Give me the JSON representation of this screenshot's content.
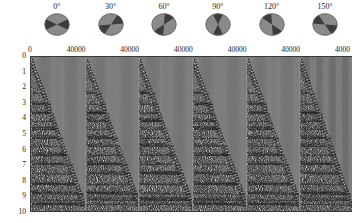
{
  "figure": {
    "type": "seismic-shot-gather-panels",
    "panel_count": 6
  },
  "beachballs": {
    "items": [
      {
        "label": "0°",
        "angle": 0,
        "icon": "beachball-icon"
      },
      {
        "label": "30°",
        "angle": 30,
        "icon": "beachball-icon"
      },
      {
        "label": "60°",
        "angle": 60,
        "icon": "beachball-icon"
      },
      {
        "label": "90°",
        "angle": 90,
        "icon": "beachball-icon"
      },
      {
        "label": "120°",
        "angle": 120,
        "icon": "beachball-icon"
      },
      {
        "label": "150°",
        "angle": 150,
        "icon": "beachball-icon"
      }
    ],
    "fill_color": "#8a8a8a",
    "quadrant_color": "#3c3c3c",
    "edge_color": "#6f6f6f"
  },
  "xaxis": {
    "tick_labels": [
      "0",
      "4000"
    ],
    "min": 0,
    "max": 4000,
    "repeat_per_panel": true
  },
  "yaxis": {
    "tick_labels": [
      "0",
      "1",
      "2",
      "3",
      "4",
      "5",
      "6",
      "7",
      "8",
      "9",
      "10"
    ],
    "min": 0,
    "max": 10
  },
  "chart_data": {
    "type": "line",
    "title": "",
    "xlabel": "",
    "ylabel": "",
    "xlim": [
      0,
      4000
    ],
    "ylim": [
      0,
      10
    ],
    "grid": false,
    "legend_position": "none",
    "panels": [
      {
        "name": "0°",
        "xlim": [
          0,
          4000
        ],
        "ylim": [
          0,
          10
        ],
        "trace_count": 56,
        "seed": 11
      },
      {
        "name": "30°",
        "xlim": [
          0,
          4000
        ],
        "ylim": [
          0,
          10
        ],
        "trace_count": 56,
        "seed": 22
      },
      {
        "name": "60°",
        "xlim": [
          0,
          4000
        ],
        "ylim": [
          0,
          10
        ],
        "trace_count": 56,
        "seed": 33
      },
      {
        "name": "90°",
        "xlim": [
          0,
          4000
        ],
        "ylim": [
          0,
          10
        ],
        "trace_count": 56,
        "seed": 44
      },
      {
        "name": "120°",
        "xlim": [
          0,
          4000
        ],
        "ylim": [
          0,
          10
        ],
        "trace_count": 56,
        "seed": 55
      },
      {
        "name": "150°",
        "xlim": [
          0,
          4000
        ],
        "ylim": [
          0,
          10
        ],
        "trace_count": 56,
        "seed": 66
      }
    ],
    "reflector_times": [
      2.3,
      3.0,
      3.6,
      4.1,
      4.6,
      5.2,
      5.7,
      6.3,
      6.9,
      7.5,
      8.2,
      8.8,
      9.2,
      9.5
    ],
    "direct_arrival_slope": 0.00235,
    "wiggle_color": "#202020"
  }
}
